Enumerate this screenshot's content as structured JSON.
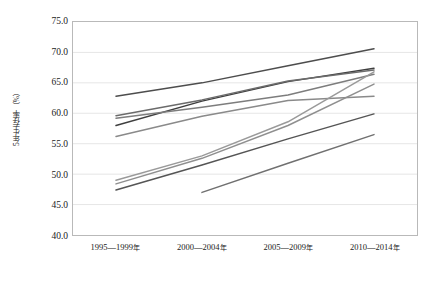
{
  "chart_data": {
    "type": "line",
    "title": "",
    "xlabel": "",
    "ylabel": "5年生存率（%）",
    "categories": [
      "1995—1999年",
      "2000—2004年",
      "2005—2009年",
      "2010—2014年"
    ],
    "ylim": [
      40.0,
      75.0
    ],
    "ytick_labels": [
      "75.0",
      "70.0",
      "65.0",
      "60.0",
      "55.0",
      "50.0",
      "45.0",
      "40.0"
    ],
    "ytick_values": [
      75.0,
      70.0,
      65.0,
      60.0,
      55.0,
      50.0,
      45.0,
      40.0
    ],
    "grid": true,
    "legend": "none",
    "series": [
      {
        "name": "series-1",
        "color": "#4d4d4d",
        "values": [
          62.8,
          65.0,
          67.8,
          70.6
        ]
      },
      {
        "name": "series-2",
        "color": "#3f3f3f",
        "values": [
          58.0,
          62.0,
          65.2,
          67.4
        ]
      },
      {
        "name": "series-3",
        "color": "#6b6b6b",
        "values": [
          59.6,
          62.2,
          65.3,
          67.1
        ]
      },
      {
        "name": "series-4",
        "color": "#7d7d7d",
        "values": [
          59.2,
          61.0,
          63.0,
          66.4
        ]
      },
      {
        "name": "series-5",
        "color": "#8a8a8a",
        "values": [
          56.2,
          59.5,
          62.1,
          62.8
        ]
      },
      {
        "name": "series-6",
        "color": "#9a9a9a",
        "values": [
          49.0,
          53.0,
          58.6,
          66.8
        ]
      },
      {
        "name": "series-7",
        "color": "#8f8f8f",
        "values": [
          48.4,
          52.6,
          58.0,
          64.8
        ]
      },
      {
        "name": "series-8",
        "color": "#555555",
        "values": [
          47.4,
          51.5,
          55.8,
          59.9
        ]
      },
      {
        "name": "series-9",
        "color": "#707070",
        "values": [
          null,
          47.0,
          51.8,
          56.5
        ]
      }
    ]
  }
}
